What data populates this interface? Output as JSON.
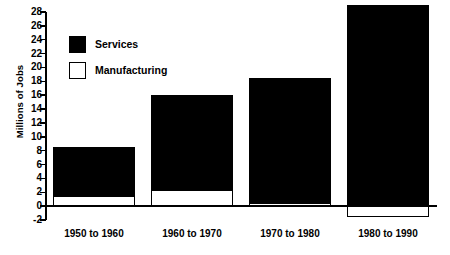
{
  "chart_data": {
    "type": "bar",
    "subtype": "stacked-bar",
    "title": "",
    "xlabel": "",
    "ylabel": "Millions of Jobs",
    "ylim": [
      -2,
      28
    ],
    "ytick_step": 2,
    "yticks": [
      28,
      26,
      24,
      22,
      20,
      18,
      16,
      14,
      12,
      10,
      8,
      6,
      4,
      2,
      0,
      -2
    ],
    "ytick_labels": [
      "28",
      "26",
      "24",
      "22",
      "20",
      "18",
      "16",
      "14",
      "12",
      "10",
      "8",
      "6",
      "4",
      "2",
      "0",
      "-2"
    ],
    "grid": false,
    "legend_position": "upper-left-inside",
    "categories": [
      "1950 to 1960",
      "1960 to 1970",
      "1970 to 1980",
      "1980 to 1990"
    ],
    "series": [
      {
        "name": "Manufacturing",
        "color": "#ffffff",
        "values": [
          1.5,
          2.3,
          0.5,
          -1.5
        ]
      },
      {
        "name": "Services",
        "color": "#000000",
        "values": [
          7.1,
          13.7,
          18.0,
          29.0
        ]
      }
    ],
    "stack_totals": [
      8.6,
      16.0,
      18.5,
      29.0
    ]
  },
  "legend": {
    "items": [
      {
        "label": "Services",
        "swatch": "filled-black-square"
      },
      {
        "label": "Manufacturing",
        "swatch": "outlined-white-square"
      }
    ]
  },
  "axes": {
    "y_title": "Millions of Jobs"
  }
}
